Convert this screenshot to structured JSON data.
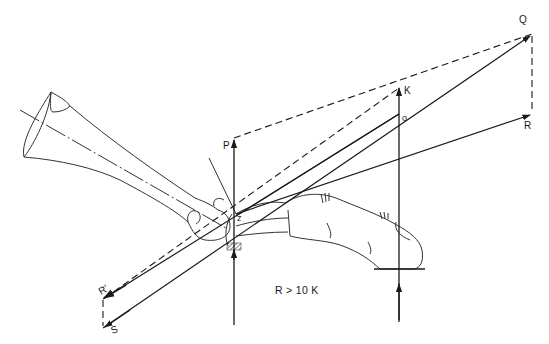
{
  "diagram": {
    "labels": {
      "Q": "Q",
      "R": "R",
      "K": "K",
      "O": "o",
      "P": "P",
      "Z": "z",
      "R_prime": "R'",
      "S": "S"
    },
    "caption": "R > 10 K",
    "colors": {
      "ink": "#1a1a1a",
      "bone_outline": "#333333",
      "background": "#ffffff"
    }
  }
}
